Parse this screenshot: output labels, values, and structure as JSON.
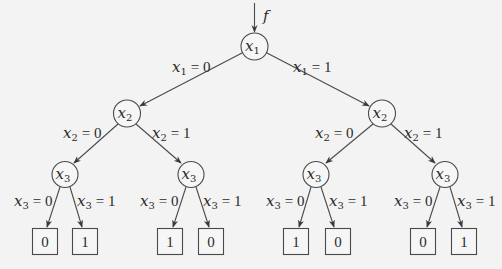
{
  "diagram": {
    "type": "binary decision tree",
    "input_label": "f",
    "root": {
      "var": "x",
      "sub": "1",
      "edge_labels": {
        "left": {
          "var": "x",
          "sub": "1",
          "rhs": "= 0"
        },
        "right": {
          "var": "x",
          "sub": "1",
          "rhs": "= 1"
        }
      }
    },
    "level2": [
      {
        "var": "x",
        "sub": "2",
        "edge_labels": {
          "left": {
            "var": "x",
            "sub": "2",
            "rhs": "= 0"
          },
          "right": {
            "var": "x",
            "sub": "2",
            "rhs": "= 1"
          }
        }
      },
      {
        "var": "x",
        "sub": "2",
        "edge_labels": {
          "left": {
            "var": "x",
            "sub": "2",
            "rhs": "= 0"
          },
          "right": {
            "var": "x",
            "sub": "2",
            "rhs": "= 1"
          }
        }
      }
    ],
    "level3": [
      {
        "var": "x",
        "sub": "3",
        "edge_labels": {
          "left": {
            "var": "x",
            "sub": "3",
            "rhs": "= 0"
          },
          "right": {
            "var": "x",
            "sub": "3",
            "rhs": "= 1"
          }
        }
      },
      {
        "var": "x",
        "sub": "3",
        "edge_labels": {
          "left": {
            "var": "x",
            "sub": "3",
            "rhs": "= 0"
          },
          "right": {
            "var": "x",
            "sub": "3",
            "rhs": "= 1"
          }
        }
      },
      {
        "var": "x",
        "sub": "3",
        "edge_labels": {
          "left": {
            "var": "x",
            "sub": "3",
            "rhs": "= 0"
          },
          "right": {
            "var": "x",
            "sub": "3",
            "rhs": "= 1"
          }
        }
      },
      {
        "var": "x",
        "sub": "3",
        "edge_labels": {
          "left": {
            "var": "x",
            "sub": "3",
            "rhs": "= 0"
          },
          "right": {
            "var": "x",
            "sub": "3",
            "rhs": "= 1"
          }
        }
      }
    ],
    "leaves": [
      "0",
      "1",
      "1",
      "0",
      "1",
      "0",
      "0",
      "1"
    ]
  }
}
